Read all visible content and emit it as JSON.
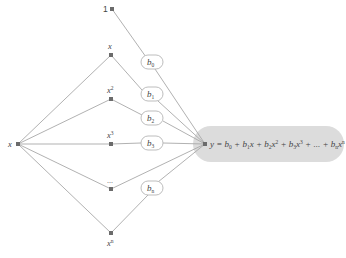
{
  "diagram": {
    "type": "polynomial-regression-network",
    "input_node": {
      "label": "x",
      "x": 18,
      "y": 144
    },
    "bias_node": {
      "label": "1",
      "x": 112,
      "y": 9
    },
    "feature_nodes": [
      {
        "label": "x",
        "sup": "",
        "x": 111,
        "y": 55
      },
      {
        "label": "x",
        "sup": "2",
        "x": 111,
        "y": 99
      },
      {
        "label": "x",
        "sup": "3",
        "x": 111,
        "y": 144
      },
      {
        "label": "...",
        "sup": "",
        "x": 111,
        "y": 189
      },
      {
        "label": "x",
        "sup": "n",
        "x": 111,
        "y": 233
      }
    ],
    "coefficients": [
      {
        "label": "b",
        "sub": "0",
        "x": 152,
        "y": 62
      },
      {
        "label": "b",
        "sub": "1",
        "x": 152,
        "y": 94
      },
      {
        "label": "b",
        "sub": "2",
        "x": 152,
        "y": 118
      },
      {
        "label": "b",
        "sub": "3",
        "x": 152,
        "y": 143
      },
      {
        "label": "b",
        "sub": "n",
        "x": 152,
        "y": 188
      }
    ],
    "output_node": {
      "x": 205,
      "y": 144
    },
    "equation": {
      "lhs": "y",
      "text": "y = b0 + b1x + b2x2 + b3x3 + ... + bnxn",
      "terms": [
        {
          "coef": "b",
          "sub": "0",
          "var": "",
          "sup": ""
        },
        {
          "coef": "b",
          "sub": "1",
          "var": "x",
          "sup": ""
        },
        {
          "coef": "b",
          "sub": "2",
          "var": "x",
          "sup": "2"
        },
        {
          "coef": "b",
          "sub": "3",
          "var": "x",
          "sup": "3"
        },
        {
          "coef": "",
          "sub": "",
          "var": "...",
          "sup": ""
        },
        {
          "coef": "b",
          "sub": "n",
          "var": "x",
          "sup": "n"
        }
      ]
    },
    "colors": {
      "edge": "#a8a8a8",
      "node": "#6b6b6b",
      "pill": "#dcdcdc",
      "bubble_border": "#b5b5b5"
    }
  }
}
